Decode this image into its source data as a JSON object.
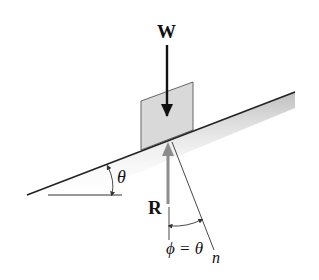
{
  "diagram": {
    "labels": {
      "weight": "W",
      "reaction": "R",
      "incline_angle": "θ",
      "phi_equation": "ϕ = θ",
      "normal": "n"
    },
    "colors": {
      "line": "#222222",
      "block_fill": "#d9d9d9",
      "block_stroke": "#555555",
      "reaction_arrow": "#8c8c8c",
      "shade": "#bdbdbd",
      "text": "#111111"
    }
  }
}
